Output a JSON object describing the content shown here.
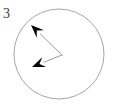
{
  "figure": {
    "label": "3",
    "background_color": "#ffffff",
    "circle_stroke_color": "#a6a6a6",
    "hand_stroke_color": "#9a9a9a",
    "arrowhead_fill_color": "#000000",
    "label_color": "#3d3d3d",
    "circle": {
      "center_x": 59,
      "center_y": 54,
      "radius": 45,
      "stroke_width": 1
    },
    "vertex": {
      "x": 62,
      "y": 55
    },
    "hands": [
      {
        "name": "upper-left-hand",
        "tip_x": 31,
        "tip_y": 25,
        "direction": "up-left",
        "angle_degrees": 136
      },
      {
        "name": "lower-left-hand",
        "tip_x": 32,
        "tip_y": 67,
        "direction": "down-left",
        "angle_degrees": 203
      }
    ]
  }
}
